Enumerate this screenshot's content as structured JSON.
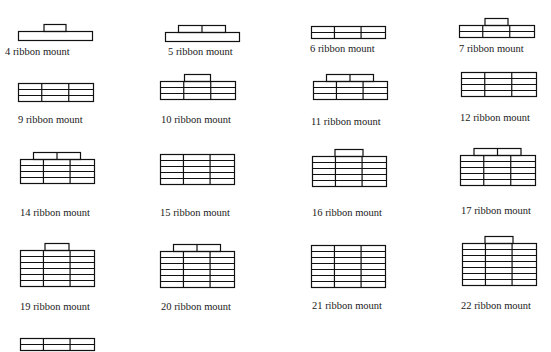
{
  "figure": {
    "stroke_color": "#111111",
    "background": "#ffffff",
    "label_suffix": "ribbon mount"
  },
  "mounts": [
    {
      "label": "4 ribbon mount",
      "x": 18,
      "y": 24,
      "w": 74,
      "rows": 1,
      "cols": 1,
      "top_cells": 1,
      "top_w": 22,
      "top_offset": 0,
      "label_x": 5,
      "label_y": 46
    },
    {
      "label": "5 ribbon mount",
      "x": 165,
      "y": 25,
      "w": 74,
      "rows": 1,
      "cols": 1,
      "top_cells": 2,
      "top_w": 47,
      "top_offset": 0,
      "label_x": 168,
      "label_y": 46
    },
    {
      "label": "6 ribbon mount",
      "x": 311,
      "y": 26,
      "w": 74,
      "rows": 2,
      "cols": 3,
      "top_cells": 0,
      "top_w": 0,
      "top_offset": 0,
      "label_x": 310,
      "label_y": 43
    },
    {
      "label": "7 ribbon mount",
      "x": 459,
      "y": 18,
      "w": 75,
      "rows": 2,
      "cols": 3,
      "top_cells": 1,
      "top_w": 23,
      "top_offset": 0,
      "label_x": 459,
      "label_y": 43
    },
    {
      "label": "9 ribbon mount",
      "x": 18,
      "y": 83,
      "w": 75,
      "rows": 3,
      "cols": 3,
      "top_cells": 0,
      "top_w": 0,
      "top_offset": 0,
      "label_x": 18,
      "label_y": 114
    },
    {
      "label": "10 ribbon mount",
      "x": 160,
      "y": 74,
      "w": 75,
      "rows": 3,
      "cols": 3,
      "top_cells": 1,
      "top_w": 26,
      "top_offset": 0,
      "label_x": 161,
      "label_y": 114
    },
    {
      "label": "11 ribbon mount",
      "x": 313,
      "y": 74,
      "w": 74,
      "rows": 3,
      "cols": 3,
      "top_cells": 2,
      "top_w": 47,
      "top_offset": 0,
      "label_x": 311,
      "label_y": 116
    },
    {
      "label": "12 ribbon mount",
      "x": 461,
      "y": 72,
      "w": 75,
      "rows": 4,
      "cols": 3,
      "top_cells": 0,
      "top_w": 0,
      "top_offset": 0,
      "label_x": 460,
      "label_y": 112
    },
    {
      "label": "14 ribbon mount",
      "x": 20,
      "y": 152,
      "w": 74,
      "rows": 4,
      "cols": 3,
      "top_cells": 2,
      "top_w": 47,
      "top_offset": 0,
      "label_x": 20,
      "label_y": 207
    },
    {
      "label": "15 ribbon mount",
      "x": 160,
      "y": 154,
      "w": 74,
      "rows": 5,
      "cols": 3,
      "top_cells": 0,
      "top_w": 0,
      "top_offset": 0,
      "label_x": 160,
      "label_y": 207
    },
    {
      "label": "16 ribbon mount",
      "x": 312,
      "y": 149,
      "w": 74,
      "rows": 5,
      "cols": 3,
      "top_cells": 1,
      "top_w": 28,
      "top_offset": 0,
      "label_x": 312,
      "label_y": 207
    },
    {
      "label": "17 ribbon mount",
      "x": 460,
      "y": 148,
      "w": 75,
      "rows": 5,
      "cols": 3,
      "top_cells": 2,
      "top_w": 47,
      "top_offset": 0,
      "label_x": 461,
      "label_y": 205
    },
    {
      "label": "19 ribbon mount",
      "x": 20,
      "y": 243,
      "w": 74,
      "rows": 6,
      "cols": 3,
      "top_cells": 1,
      "top_w": 24,
      "top_offset": 0,
      "label_x": 20,
      "label_y": 301
    },
    {
      "label": "20 ribbon mount",
      "x": 160,
      "y": 244,
      "w": 74,
      "rows": 6,
      "cols": 3,
      "top_cells": 2,
      "top_w": 47,
      "top_offset": 0,
      "label_x": 161,
      "label_y": 301
    },
    {
      "label": "21 ribbon mount",
      "x": 311,
      "y": 245,
      "w": 74,
      "rows": 7,
      "cols": 3,
      "top_cells": 0,
      "top_w": 0,
      "top_offset": 0,
      "label_x": 312,
      "label_y": 300
    },
    {
      "label": "22 ribbon mount",
      "x": 462,
      "y": 236,
      "w": 74,
      "rows": 7,
      "cols": 3,
      "top_cells": 1,
      "top_w": 28,
      "top_offset": 0,
      "label_x": 461,
      "label_y": 300
    },
    {
      "label": "",
      "x": 20,
      "y": 338,
      "w": 74,
      "rows": 2,
      "cols": 3,
      "top_cells": 0,
      "top_w": 0,
      "top_offset": 0,
      "label_x": 20,
      "label_y": 360
    }
  ]
}
